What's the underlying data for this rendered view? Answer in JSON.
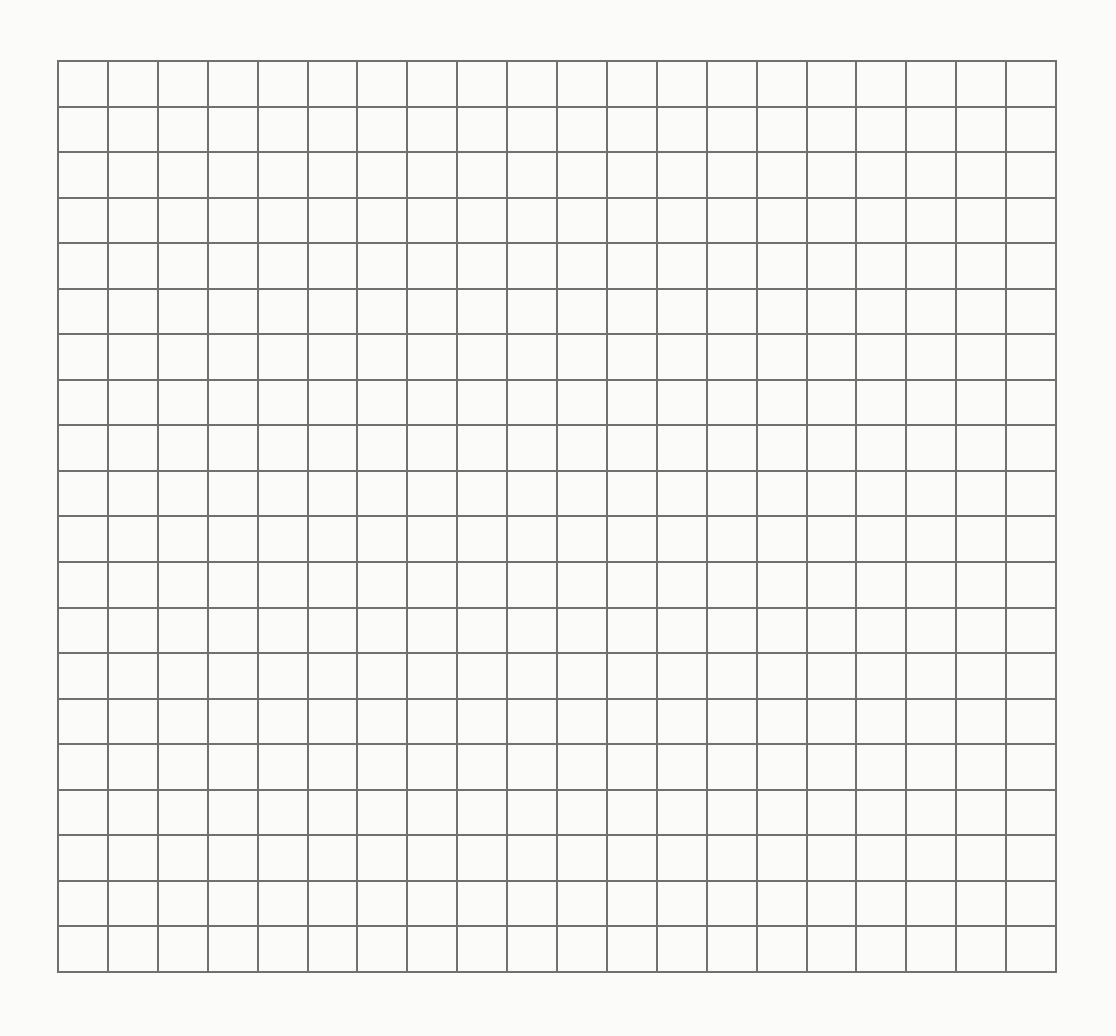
{
  "grid": {
    "rows": 20,
    "columns": 20,
    "line_color": "#707070",
    "background_color": "#fbfbfa",
    "cells_filled": []
  }
}
